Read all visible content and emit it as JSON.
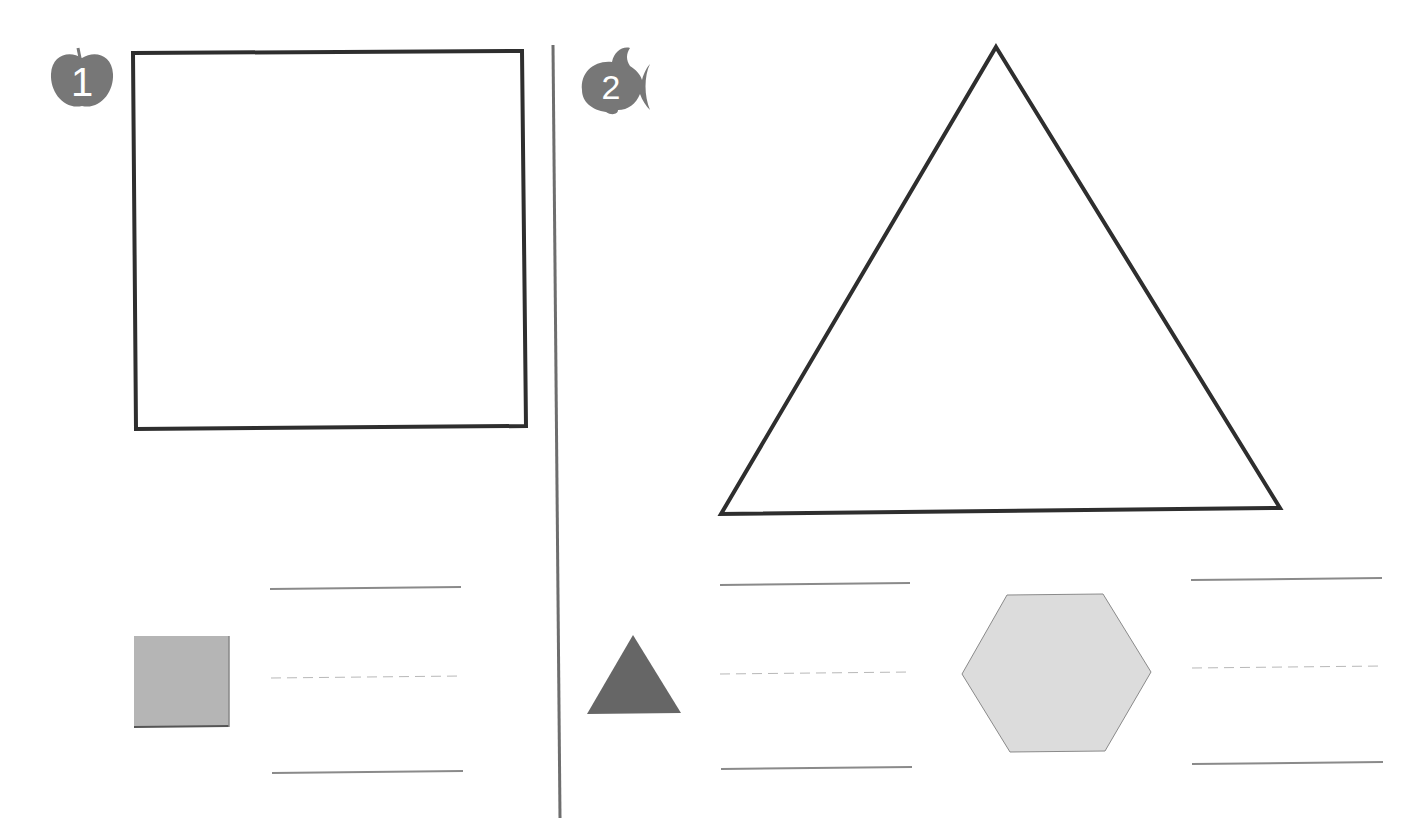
{
  "worksheet": {
    "colors": {
      "outline": "#2e2e2e",
      "badge": "#777777",
      "divider": "#6e6e6e",
      "rule_solid": "#8a8a8a",
      "rule_dashed": "#b8b8b8",
      "square_fill": "#b5b5b5",
      "triangle_fill": "#666666",
      "hexagon_fill": "#dcdcdc"
    },
    "sections": [
      {
        "number": "1",
        "badge_icon": "apple-icon",
        "trace_shape": "square",
        "sample_shapes": [
          "square"
        ]
      },
      {
        "number": "2",
        "badge_icon": "fish-icon",
        "trace_shape": "triangle",
        "sample_shapes": [
          "triangle",
          "hexagon"
        ]
      }
    ]
  }
}
